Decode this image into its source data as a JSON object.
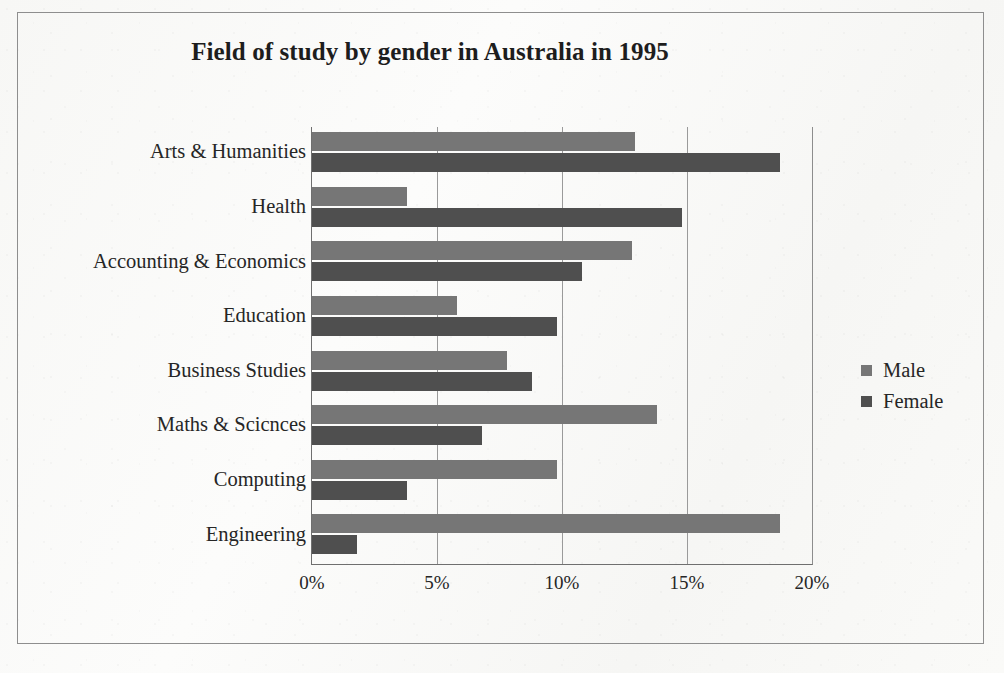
{
  "document": {
    "kind": "scanned-figure",
    "outer_border_color": "#8e8e8e",
    "page_background": "#f8f8f6"
  },
  "legend": {
    "position": "right",
    "entries": [
      {
        "label": "Male",
        "color": "#767676",
        "swatch": "square-swatch-male"
      },
      {
        "label": "Female",
        "color": "#4f4f4f",
        "swatch": "square-swatch-female"
      }
    ]
  },
  "axis": {
    "x_ticks": [
      "0%",
      "5%",
      "10%",
      "15%",
      "20%"
    ],
    "x_tick_values": [
      0,
      5,
      10,
      15,
      20
    ],
    "gridlines": true
  },
  "chart_data": {
    "type": "bar",
    "orientation": "horizontal",
    "title": "Field of study by gender in Australia in 1995",
    "xlabel": "",
    "ylabel": "",
    "xlim": [
      0,
      20
    ],
    "grid": true,
    "legend_position": "right",
    "value_unit": "%",
    "categories": [
      "Arts & Humanities",
      "Health",
      "Accounting & Economics",
      "Education",
      "Business Studies",
      "Maths & Scicnces",
      "Computing",
      "Engineering"
    ],
    "series": [
      {
        "name": "Male",
        "color": "#767676",
        "values": [
          12.9,
          3.8,
          12.8,
          5.8,
          7.8,
          13.8,
          9.8,
          18.7
        ]
      },
      {
        "name": "Female",
        "color": "#4f4f4f",
        "values": [
          18.7,
          14.8,
          10.8,
          9.8,
          8.8,
          6.8,
          3.8,
          1.8
        ]
      }
    ]
  }
}
